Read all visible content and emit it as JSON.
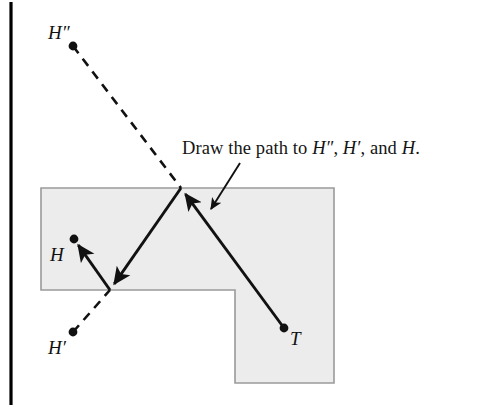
{
  "figure": {
    "background_color": "#ffffff",
    "stroke_color": "#111111",
    "shape_fill_color": "#ececec",
    "shape_border_color": "#9a9a9a",
    "rule_color": "#000000",
    "caption": {
      "prefix": "Draw the path to ",
      "point_1": "H″",
      "sep_1": ", ",
      "point_2": "H′",
      "sep_2": ", and ",
      "point_3": "H",
      "suffix": ".",
      "full_text": "Draw the path to H″, H′, and H."
    },
    "points": [
      {
        "id": "H-double-prime",
        "label": "H″",
        "x": 73,
        "y": 46,
        "label_x": 48,
        "label_y": 23
      },
      {
        "id": "H",
        "label": "H",
        "x": 74,
        "y": 239,
        "label_x": 50,
        "label_y": 245
      },
      {
        "id": "H-prime",
        "label": "H′",
        "x": 73,
        "y": 332,
        "label_x": 48,
        "label_y": 338
      },
      {
        "id": "T",
        "label": "T",
        "x": 284,
        "y": 328,
        "label_x": 290,
        "label_y": 329
      }
    ],
    "reflection_vertices": [
      {
        "id": "top-vertex",
        "x": 181,
        "y": 188
      },
      {
        "id": "lower-vertex",
        "x": 110,
        "y": 290
      }
    ],
    "shape": {
      "name": "L-shaped-room",
      "polygon": "41,188 334,188 334,383 235,383 235,290 41,290"
    },
    "solid_path_segments": [
      {
        "id": "T-to-top-vertex",
        "x1": 284,
        "y1": 328,
        "x2": 181,
        "y2": 188
      },
      {
        "id": "top-vertex-to-lower-vertex",
        "x1": 181,
        "y1": 188,
        "x2": 110,
        "y2": 290
      },
      {
        "id": "lower-vertex-to-H",
        "x1": 110,
        "y1": 290,
        "x2": 74,
        "y2": 239
      }
    ],
    "dashed_path_segments": [
      {
        "id": "H-double-prime-to-top-vertex",
        "x1": 73,
        "y1": 46,
        "x2": 181,
        "y2": 188
      },
      {
        "id": "H-prime-to-lower-vertex",
        "x1": 73,
        "y1": 332,
        "x2": 110,
        "y2": 290
      }
    ],
    "caption_pointer": {
      "x1": 240,
      "y1": 163,
      "x2": 211,
      "y2": 209
    },
    "left_rule": {
      "x": 11,
      "y1": 2,
      "y2": 405
    }
  }
}
